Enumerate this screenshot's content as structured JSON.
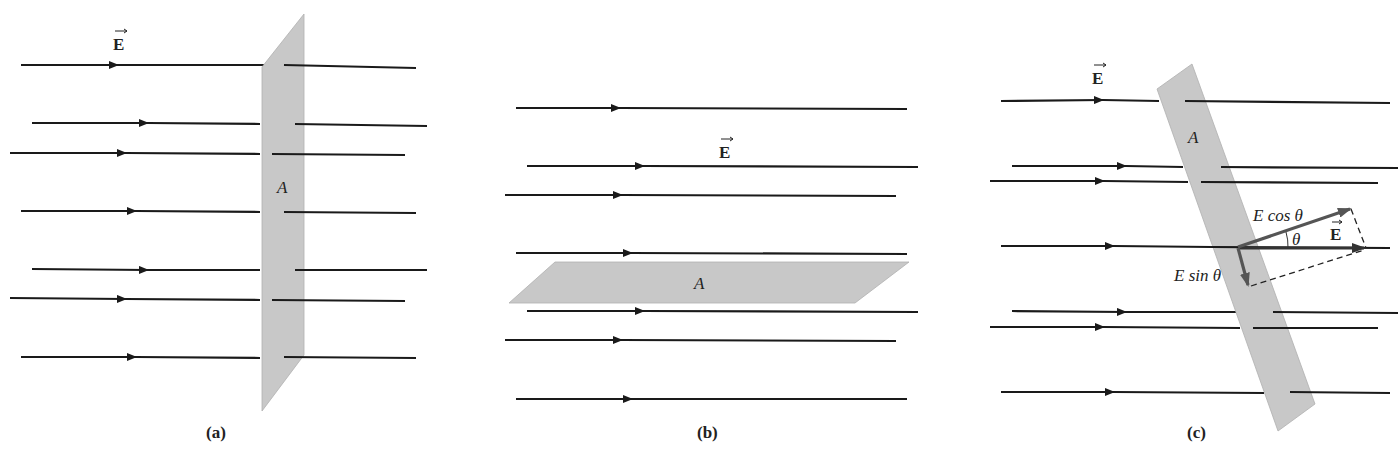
{
  "figure": {
    "panels": [
      {
        "id": "a",
        "caption": "(a)",
        "field_label": "E",
        "area_label": "A",
        "description": "Uniform field lines perpendicular to area A (plate facing the field)"
      },
      {
        "id": "b",
        "caption": "(b)",
        "field_label": "E",
        "area_label": "A",
        "description": "Uniform field lines parallel to area A (plate lying flat, no lines pass through)"
      },
      {
        "id": "c",
        "caption": "(c)",
        "field_label": "E",
        "area_label": "A",
        "vector_label": "E",
        "component_parallel_label": "E cos θ",
        "component_perpendicular_label": "E sin θ",
        "angle_label": "θ",
        "description": "Field lines at angle θ to the plate normal; E decomposed into E cos θ and E sin θ components"
      }
    ],
    "colors": {
      "field_line": "#1a1a1a",
      "plate_fill": "#c8c8c8",
      "component_vector": "#555555",
      "background": "#ffffff"
    }
  }
}
